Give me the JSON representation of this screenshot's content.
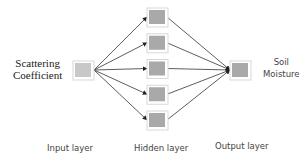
{
  "diagram": {
    "type": "neural-network",
    "input": {
      "label_line1": "Scattering",
      "label_line2": "Coefficient",
      "layer_label": "Input layer"
    },
    "hidden": {
      "node_count": 5,
      "layer_label": "Hidden layer"
    },
    "output": {
      "label_line1": "Soil",
      "label_line2": "Moisture",
      "layer_label": "Output layer"
    },
    "colors": {
      "node_fill": "#a9a9a9",
      "node_border": "#d8d8d8",
      "input_fill": "#c8c8c8",
      "edge": "#333333"
    }
  }
}
